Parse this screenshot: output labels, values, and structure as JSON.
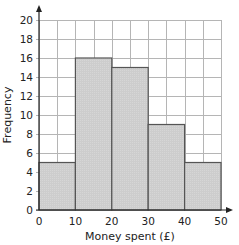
{
  "chart_data": {
    "type": "bar",
    "subtype": "histogram",
    "title": "",
    "xlabel": "Money spent (£)",
    "ylabel": "Frequency",
    "categories": [
      "0–10",
      "10–20",
      "20–30",
      "30–40",
      "40–50"
    ],
    "bins": [
      [
        0,
        10
      ],
      [
        10,
        20
      ],
      [
        20,
        30
      ],
      [
        30,
        40
      ],
      [
        40,
        50
      ]
    ],
    "values": [
      5,
      16,
      15,
      9,
      5
    ],
    "xlim": [
      0,
      50
    ],
    "ylim": [
      0,
      20
    ],
    "x_ticks": [
      0,
      10,
      20,
      30,
      40,
      50
    ],
    "y_ticks": [
      0,
      2,
      4,
      6,
      8,
      10,
      12,
      14,
      16,
      18,
      20
    ],
    "x_minor_grid_step": 5,
    "y_grid_step": 2,
    "grid": true,
    "legend": null,
    "colors": {
      "bar_fill": "#cfcfcf",
      "bar_edge": "#555555",
      "grid": "#b5b5b5",
      "axis": "#222222"
    }
  }
}
